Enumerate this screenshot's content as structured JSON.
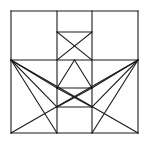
{
  "figure": {
    "background_color": "#ffffff",
    "line_color": "#1a1a1a",
    "stroke_width": 1.1,
    "canvas": {
      "width": 150,
      "height": 146
    },
    "geometry": {
      "frame": {
        "left": 11,
        "top": 11,
        "right": 138,
        "bottom": 133
      },
      "vertical_guides_x": [
        57,
        92
      ],
      "horizontal_guides_y": [
        60,
        32,
        88,
        107
      ],
      "left_mid_node": {
        "x": 11,
        "y": 60
      },
      "right_mid_node": {
        "x": 138,
        "y": 60
      },
      "center_node": {
        "x": 74.5,
        "y": 60
      }
    },
    "segments": [
      {
        "name": "frame-top",
        "x1": 11,
        "y1": 11,
        "x2": 138,
        "y2": 11
      },
      {
        "name": "frame-right",
        "x1": 138,
        "y1": 11,
        "x2": 138,
        "y2": 133
      },
      {
        "name": "frame-bottom",
        "x1": 138,
        "y1": 133,
        "x2": 11,
        "y2": 133
      },
      {
        "name": "frame-left",
        "x1": 11,
        "y1": 133,
        "x2": 11,
        "y2": 11
      },
      {
        "name": "vertical-left-col",
        "x1": 57,
        "y1": 11,
        "x2": 57,
        "y2": 133
      },
      {
        "name": "vertical-right-col",
        "x1": 92,
        "y1": 11,
        "x2": 92,
        "y2": 133
      },
      {
        "name": "horizontal-mid",
        "x1": 11,
        "y1": 60,
        "x2": 138,
        "y2": 60
      },
      {
        "name": "inner-top-bar",
        "x1": 57,
        "y1": 32,
        "x2": 92,
        "y2": 32
      },
      {
        "name": "inner-lower-bar",
        "x1": 57,
        "y1": 88,
        "x2": 92,
        "y2": 88
      },
      {
        "name": "inner-bottom-bar",
        "x1": 57,
        "y1": 107,
        "x2": 92,
        "y2": 107
      },
      {
        "name": "upper-x-left",
        "x1": 57,
        "y1": 32,
        "x2": 92,
        "y2": 60
      },
      {
        "name": "upper-x-right",
        "x1": 92,
        "y1": 32,
        "x2": 57,
        "y2": 60
      },
      {
        "name": "mid-v-left",
        "x1": 57,
        "y1": 88,
        "x2": 74.5,
        "y2": 60
      },
      {
        "name": "mid-v-right",
        "x1": 92,
        "y1": 88,
        "x2": 74.5,
        "y2": 60
      },
      {
        "name": "lower-x-left",
        "x1": 57,
        "y1": 88,
        "x2": 92,
        "y2": 107
      },
      {
        "name": "lower-x-right",
        "x1": 92,
        "y1": 88,
        "x2": 57,
        "y2": 107
      },
      {
        "name": "left-fan-to-lowbar",
        "x1": 11,
        "y1": 60,
        "x2": 57,
        "y2": 88
      },
      {
        "name": "left-fan-to-botbar",
        "x1": 11,
        "y1": 60,
        "x2": 57,
        "y2": 107
      },
      {
        "name": "left-fan-to-base",
        "x1": 11,
        "y1": 60,
        "x2": 57,
        "y2": 133
      },
      {
        "name": "right-fan-to-lowbar",
        "x1": 138,
        "y1": 60,
        "x2": 92,
        "y2": 88
      },
      {
        "name": "right-fan-to-botbar",
        "x1": 138,
        "y1": 60,
        "x2": 92,
        "y2": 107
      },
      {
        "name": "right-fan-to-base",
        "x1": 138,
        "y1": 60,
        "x2": 92,
        "y2": 133
      },
      {
        "name": "left-long-diagonal",
        "x1": 11,
        "y1": 60,
        "x2": 138,
        "y2": 133
      },
      {
        "name": "right-long-diagonal",
        "x1": 138,
        "y1": 60,
        "x2": 11,
        "y2": 133
      }
    ]
  }
}
